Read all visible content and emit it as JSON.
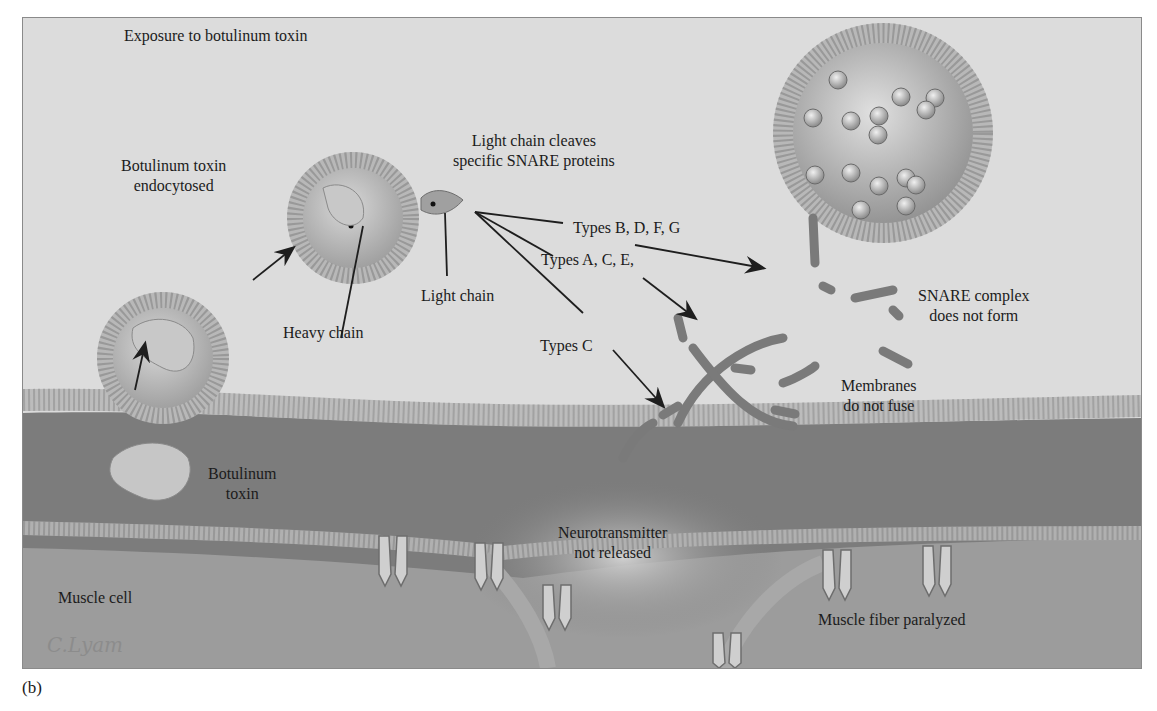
{
  "figure": {
    "panel_label": "(b)",
    "signature": "C.Lyam",
    "labels": {
      "exposure": "Exposure to botulinum toxin",
      "endocytosed_line1": "Botulinum toxin",
      "endocytosed_line2": "endocytosed",
      "light_chain_cleaves_line1": "Light chain cleaves",
      "light_chain_cleaves_line2": "specific SNARE proteins",
      "types_bdfg": "Types B, D, F, G",
      "types_ace": "Types A, C, E,",
      "types_c": "Types C",
      "light_chain": "Light chain",
      "heavy_chain": "Heavy chain",
      "snare_line1": "SNARE complex",
      "snare_line2": "does not form",
      "membranes_line1": "Membranes",
      "membranes_line2": "do not fuse",
      "toxin_line1": "Botulinum",
      "toxin_line2": "toxin",
      "neurotransmitter_line1": "Neurotransmitter",
      "neurotransmitter_line2": "not released",
      "muscle_cell": "Muscle cell",
      "muscle_fiber": "Muscle fiber paralyzed"
    },
    "colors": {
      "extracellular": "#dcdcdc",
      "nerve_terminal": "#7a7a7a",
      "muscle": "#9a9a9a",
      "membrane": "#b8b8b8",
      "protein": "#c4c4c4",
      "arrow": "#1e1e1e"
    }
  }
}
